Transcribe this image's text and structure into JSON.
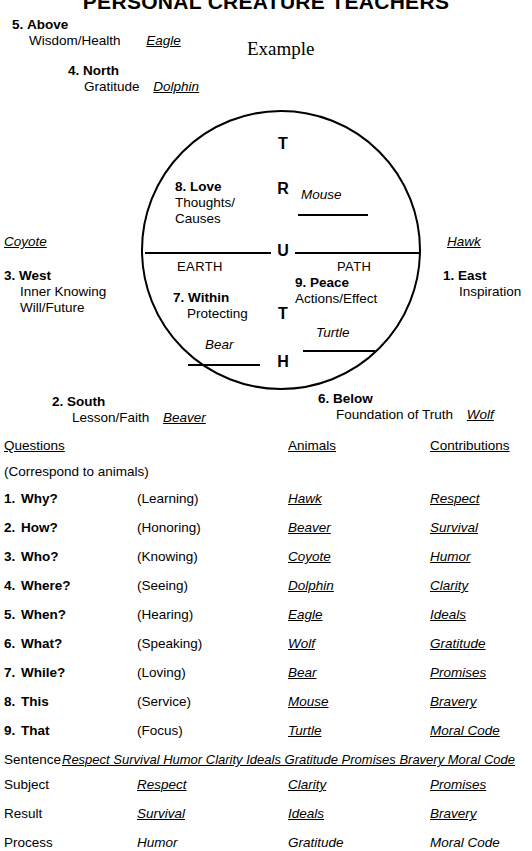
{
  "title": "PERSONAL CREATURE TEACHERS",
  "example_label": "Example",
  "directions": {
    "above": {
      "num": "5.",
      "name": "Above",
      "attribute": "Wisdom/Health",
      "animal": "Eagle"
    },
    "north": {
      "num": "4.",
      "name": "North",
      "attribute": "Gratitude",
      "animal": "Dolphin"
    },
    "west": {
      "num": "3.",
      "name": "West",
      "attribute_1": "Inner Knowing",
      "attribute_2": "Will/Future",
      "animal": "Coyote"
    },
    "east": {
      "num": "1.",
      "name": "East",
      "attribute_1": "Inspiration",
      "animal": "Hawk"
    },
    "south": {
      "num": "2.",
      "name": "South",
      "attribute": "Lesson/Faith",
      "animal": "Beaver"
    },
    "below": {
      "num": "6.",
      "name": "Below",
      "attribute": "Foundation of Truth",
      "animal": "Wolf"
    }
  },
  "circle": {
    "truth_letters": [
      "T",
      "R",
      "U",
      "T",
      "H"
    ],
    "earth_label": "EARTH",
    "path_label": "PATH",
    "quadrants": {
      "love": {
        "num": "8.",
        "name": "Love",
        "line_1": "Thoughts/",
        "line_2": "Causes",
        "animal": "Mouse"
      },
      "within": {
        "num": "7.",
        "name": "Within",
        "line_1": "Protecting",
        "animal": "Bear"
      },
      "peace": {
        "num": "9.",
        "name": "Peace",
        "line_1": "Actions/Effect",
        "animal": "Turtle"
      }
    }
  },
  "table": {
    "headers": {
      "questions": "Questions",
      "animals": "Animals",
      "contributions": "Contributions"
    },
    "subhead": "(Correspond to animals)",
    "rows": [
      {
        "num": "1.",
        "question": "Why?",
        "paren": "(Learning)",
        "animal": "Hawk",
        "contribution": "Respect"
      },
      {
        "num": "2.",
        "question": "How?",
        "paren": "(Honoring)",
        "animal": "Beaver",
        "contribution": "Survival"
      },
      {
        "num": "3.",
        "question": "Who?",
        "paren": "(Knowing)",
        "animal": "Coyote",
        "contribution": "Humor"
      },
      {
        "num": "4.",
        "question": "Where?",
        "paren": "(Seeing)",
        "animal": "Dolphin",
        "contribution": "Clarity"
      },
      {
        "num": "5.",
        "question": "When?",
        "paren": "(Hearing)",
        "animal": "Eagle",
        "contribution": "Ideals"
      },
      {
        "num": "6.",
        "question": "What?",
        "paren": "(Speaking)",
        "animal": "Wolf",
        "contribution": "Gratitude"
      },
      {
        "num": "7.",
        "question": "While?",
        "paren": "(Loving)",
        "animal": "Bear",
        "contribution": "Promises"
      },
      {
        "num": "8.",
        "question": "This",
        "paren": "(Service)",
        "animal": "Mouse",
        "contribution": "Bravery"
      },
      {
        "num": "9.",
        "question": "That",
        "paren": "(Focus)",
        "animal": "Turtle",
        "contribution": "Moral Code"
      }
    ],
    "sentence": {
      "label": "Sentence",
      "text": "Respect Survival Humor Clarity Ideals Gratitude Promises Bravery Moral Code"
    },
    "summary_rows": [
      {
        "label": "Subject",
        "c1": "Respect",
        "c2": "Clarity",
        "c3": "Promises"
      },
      {
        "label": "Result",
        "c1": "Survival",
        "c2": "Ideals",
        "c3": "Bravery"
      },
      {
        "label": "Process",
        "c1": "Humor",
        "c2": "Gratitude",
        "c3": "Moral Code"
      }
    ]
  },
  "colors": {
    "ink": "#000000",
    "paper": "#ffffff"
  }
}
